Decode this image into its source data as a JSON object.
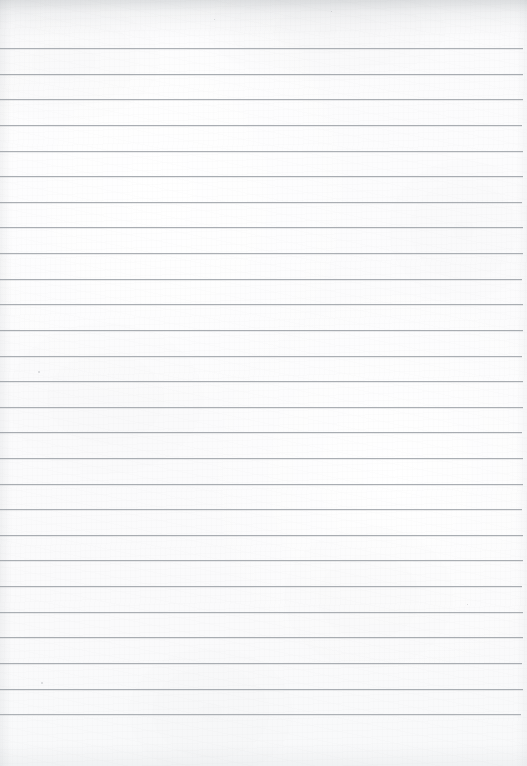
{
  "document": {
    "title": "Lined Notebook Paper",
    "kind": "scanned-blank-ruled-page",
    "content_text": "",
    "handwriting": "",
    "page_number": "",
    "width_px": 527,
    "height_px": 766
  },
  "paper": {
    "background_color": "#fcfcfd",
    "edge_shadow_color": "#8c9196",
    "texture": "subtle-fiber-mottle"
  },
  "ruling": {
    "line_color": "#9ba0a6",
    "line_thickness_px": 1,
    "line_count": 27,
    "first_line_y": 48,
    "line_spacing_px": 25.6,
    "line_left_x": 0,
    "line_right_x": 523,
    "margin_rule": "none",
    "lines": [
      {
        "index": 1,
        "y": 48,
        "left": 0,
        "right": 523,
        "opacity": 0.82
      },
      {
        "index": 2,
        "y": 74,
        "left": 0,
        "right": 523,
        "opacity": 0.86
      },
      {
        "index": 3,
        "y": 99,
        "left": 0,
        "right": 523,
        "opacity": 0.84
      },
      {
        "index": 4,
        "y": 125,
        "left": 0,
        "right": 522,
        "opacity": 0.85
      },
      {
        "index": 5,
        "y": 151,
        "left": 0,
        "right": 523,
        "opacity": 0.83
      },
      {
        "index": 6,
        "y": 176,
        "left": 0,
        "right": 523,
        "opacity": 0.86
      },
      {
        "index": 7,
        "y": 202,
        "left": 0,
        "right": 522,
        "opacity": 0.84
      },
      {
        "index": 8,
        "y": 227,
        "left": 0,
        "right": 523,
        "opacity": 0.85
      },
      {
        "index": 9,
        "y": 253,
        "left": 0,
        "right": 523,
        "opacity": 0.83
      },
      {
        "index": 10,
        "y": 279,
        "left": 0,
        "right": 522,
        "opacity": 0.86
      },
      {
        "index": 11,
        "y": 304,
        "left": 0,
        "right": 523,
        "opacity": 0.84
      },
      {
        "index": 12,
        "y": 330,
        "left": 0,
        "right": 523,
        "opacity": 0.85
      },
      {
        "index": 13,
        "y": 356,
        "left": 0,
        "right": 522,
        "opacity": 0.83
      },
      {
        "index": 14,
        "y": 381,
        "left": 0,
        "right": 523,
        "opacity": 0.85
      },
      {
        "index": 15,
        "y": 407,
        "left": 0,
        "right": 523,
        "opacity": 0.84
      },
      {
        "index": 16,
        "y": 432,
        "left": 0,
        "right": 522,
        "opacity": 0.86
      },
      {
        "index": 17,
        "y": 458,
        "left": 0,
        "right": 523,
        "opacity": 0.84
      },
      {
        "index": 18,
        "y": 484,
        "left": 0,
        "right": 523,
        "opacity": 0.85
      },
      {
        "index": 19,
        "y": 509,
        "left": 0,
        "right": 522,
        "opacity": 0.83
      },
      {
        "index": 20,
        "y": 535,
        "left": 0,
        "right": 523,
        "opacity": 0.86
      },
      {
        "index": 21,
        "y": 560,
        "left": 0,
        "right": 523,
        "opacity": 0.84
      },
      {
        "index": 22,
        "y": 586,
        "left": 0,
        "right": 522,
        "opacity": 0.85
      },
      {
        "index": 23,
        "y": 612,
        "left": 0,
        "right": 523,
        "opacity": 0.83
      },
      {
        "index": 24,
        "y": 637,
        "left": 0,
        "right": 523,
        "opacity": 0.86
      },
      {
        "index": 25,
        "y": 663,
        "left": 0,
        "right": 522,
        "opacity": 0.84
      },
      {
        "index": 26,
        "y": 689,
        "left": 0,
        "right": 523,
        "opacity": 0.85
      },
      {
        "index": 27,
        "y": 714,
        "left": 0,
        "right": 521,
        "opacity": 0.8
      }
    ]
  },
  "artifacts": {
    "specks": [
      {
        "x": 38,
        "y": 371,
        "size": 2
      },
      {
        "x": 41,
        "y": 682,
        "size": 2
      },
      {
        "x": 214,
        "y": 19,
        "size": 1
      },
      {
        "x": 331,
        "y": 11,
        "size": 1
      },
      {
        "x": 467,
        "y": 604,
        "size": 1
      }
    ]
  }
}
